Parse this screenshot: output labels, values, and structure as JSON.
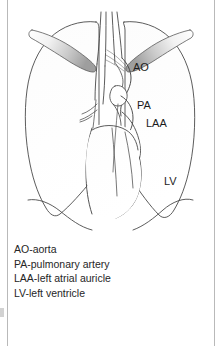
{
  "figure": {
    "type": "anatomical-line-diagram",
    "background_color": "#ffffff",
    "stroke_color": "#4a4a4a",
    "frame_color": "#b9b9b9"
  },
  "annotations": {
    "ao": "AO",
    "pa": "PA",
    "laa": "LAA",
    "lv": "LV"
  },
  "legend": {
    "lines": [
      "AO-aorta",
      "PA-pulmonary artery",
      "LAA-left atrial auricle",
      "LV-left ventricle"
    ]
  }
}
